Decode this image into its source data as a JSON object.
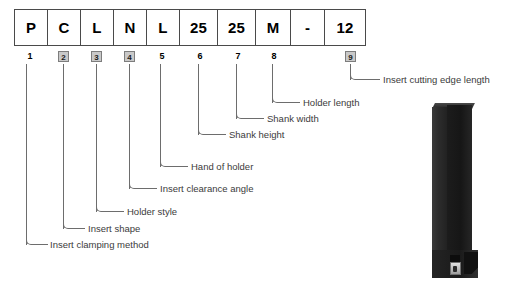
{
  "diagram": {
    "code_cells": [
      {
        "value": "P",
        "index": "1",
        "boxed_index": false,
        "width": 33
      },
      {
        "value": "C",
        "index": "2",
        "boxed_index": true,
        "width": 33
      },
      {
        "value": "L",
        "index": "3",
        "boxed_index": true,
        "width": 33
      },
      {
        "value": "N",
        "index": "4",
        "boxed_index": true,
        "width": 33
      },
      {
        "value": "L",
        "index": "5",
        "boxed_index": false,
        "width": 33
      },
      {
        "value": "25",
        "index": "6",
        "boxed_index": false,
        "width": 38
      },
      {
        "value": "25",
        "index": "7",
        "boxed_index": false,
        "width": 38
      },
      {
        "value": "M",
        "index": "8",
        "boxed_index": false,
        "width": 35
      },
      {
        "value": "-",
        "index": "",
        "boxed_index": false,
        "width": 34
      },
      {
        "value": "12",
        "index": "9",
        "boxed_index": true,
        "width": 40
      }
    ],
    "callouts": [
      {
        "index": "1",
        "label": "Insert clamping method"
      },
      {
        "index": "2",
        "label": "Insert shape"
      },
      {
        "index": "3",
        "label": "Holder style"
      },
      {
        "index": "4",
        "label": "Insert clearance angle"
      },
      {
        "index": "5",
        "label": "Hand of holder"
      },
      {
        "index": "6",
        "label": "Shank height"
      },
      {
        "index": "7",
        "label": "Shank width"
      },
      {
        "index": "8",
        "label": "Holder length"
      },
      {
        "index": "9",
        "label": "Insert cutting edge length"
      }
    ],
    "holder_image": {
      "name": "turning-tool-holder-photo",
      "description": "Black square shank turning tool holder with carbide insert at head"
    },
    "colors": {
      "line": "#6d6d6d",
      "text": "#3b3b3b",
      "code_text": "#000000",
      "grid_border": "#4a4a4a",
      "index_box_fill": "#c9c9c9",
      "background": "#ffffff"
    }
  }
}
